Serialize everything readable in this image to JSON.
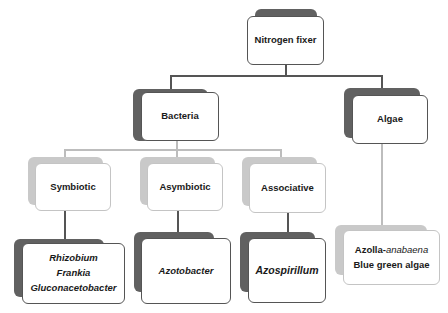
{
  "diagram": {
    "root": {
      "label": "Nitrogen fixer"
    },
    "level1": [
      {
        "label": "Bacteria"
      },
      {
        "label": "Algae"
      }
    ],
    "bacteria_types": [
      {
        "label": "Symbiotic"
      },
      {
        "label": "Asymbiotic"
      },
      {
        "label": "Associative"
      }
    ],
    "algae_examples": {
      "line1_prefix": "Azolla-",
      "line1_italic": "anabaena",
      "line2": "Blue green algae"
    },
    "examples": {
      "symbiotic": [
        "Rhizobium",
        "Frankia",
        "Gluconacetobacter"
      ],
      "asymbiotic": [
        "Azotobacter"
      ],
      "associative": [
        "Azospirillum"
      ]
    },
    "colors": {
      "dark_shadow": "#616161",
      "light_shadow": "#c9c9c9",
      "connector_dark": "#555555",
      "connector_light": "#bdbdbd"
    }
  }
}
